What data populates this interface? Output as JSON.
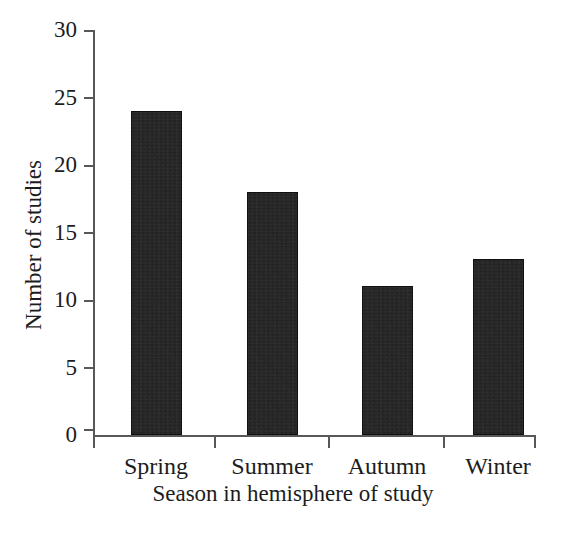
{
  "chart_data": {
    "type": "bar",
    "title": "",
    "subtitle": "",
    "xlabel": "Season in hemisphere of study",
    "ylabel": "Number of studies",
    "categories": [
      "Spring",
      "Summer",
      "Autumn",
      "Winter"
    ],
    "values": [
      24,
      18,
      11,
      13
    ],
    "ylim": [
      0,
      30
    ],
    "y_ticks": [
      0,
      5,
      10,
      15,
      20,
      25,
      30
    ],
    "y_tick_labels": [
      "0",
      "5",
      "10",
      "15",
      "20",
      "25",
      "30"
    ],
    "grid": false,
    "legend": null,
    "legend_position": "none",
    "bar_color": "#1e1d1d",
    "axis_color": "#58585a",
    "background_color": "#ffffff",
    "annotations": []
  },
  "figure": {
    "width": 586,
    "height": 537
  }
}
